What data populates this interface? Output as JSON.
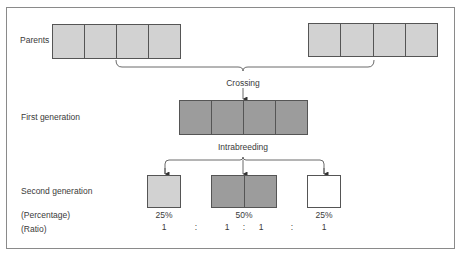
{
  "labels": {
    "parents": "Parents",
    "first_generation": "First generation",
    "second_generation": "Second generation",
    "percentage": "(Percentage)",
    "ratio": "(Ratio)"
  },
  "processes": {
    "crossing": "Crossing",
    "intrabreeding": "Intrabreeding"
  },
  "second_generation": [
    {
      "percentage": "25%",
      "ratio": "1",
      "shade": "light"
    },
    {
      "percentage": "50%",
      "ratio_left": "1",
      "ratio_right": "1",
      "shade": "dark"
    },
    {
      "percentage": "25%",
      "ratio": "1",
      "shade": "white"
    }
  ],
  "ratio_separators": [
    ":",
    ":",
    ":"
  ],
  "colors": {
    "light": "#d2d2d2",
    "dark": "#9c9c9c",
    "white": "#ffffff",
    "border": "#555555"
  }
}
